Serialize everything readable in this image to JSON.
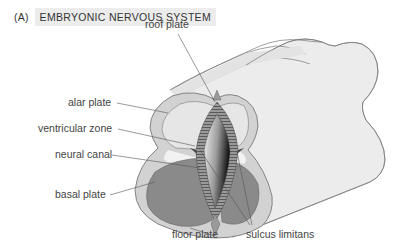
{
  "header": {
    "tag": "(A)",
    "title": "EMBRYONIC NERVOUS SYSTEM"
  },
  "labels": {
    "roof_plate": "roof plate",
    "alar_plate": "alar plate",
    "ventricular_zone": "ventricular zone",
    "neural_canal": "neural canal",
    "basal_plate": "basal plate",
    "floor_plate": "floor plate",
    "sulcus_limitans": "sulcus limitans"
  },
  "colors": {
    "tube_surface": "#e9e9e9",
    "outer_layer": "#d4d4d4",
    "alar": "#e2e2e2",
    "basal": "#8a8a8a",
    "ventricular": "#6f6f6f",
    "outline": "#707070",
    "label_text": "#444444",
    "title_bg": "#ececec"
  }
}
